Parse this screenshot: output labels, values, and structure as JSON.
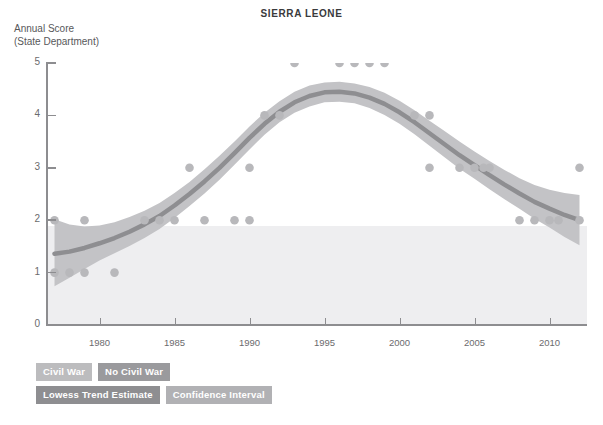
{
  "title": "SIERRA LEONE",
  "y_axis_label": "Annual Score\n(State Department)",
  "legend": [
    {
      "key": "civil_war",
      "label": "Civil War",
      "color": "#bcbcbe"
    },
    {
      "key": "no_civil_war",
      "label": "No Civil War",
      "color": "#9a9a9d"
    },
    {
      "key": "lowess",
      "label": "Lowess Trend Estimate",
      "color": "#8e8e91"
    },
    {
      "key": "confidence_interval",
      "label": "Confidence Interval",
      "color": "#b1b1b4"
    }
  ],
  "chart_data": {
    "type": "scatter",
    "title": "SIERRA LEONE",
    "xlabel": "",
    "ylabel": "Annual Score (State Department)",
    "xlim": [
      1976.5,
      2012.5
    ],
    "ylim": [
      0,
      5
    ],
    "yticks": [
      0,
      1,
      2,
      3,
      4,
      5
    ],
    "xticks": [
      1980,
      1985,
      1990,
      1995,
      2000,
      2005,
      2010
    ],
    "grid": false,
    "legend_position": "below-left",
    "points": [
      {
        "x": 1977,
        "y": 2
      },
      {
        "x": 1977,
        "y": 1
      },
      {
        "x": 1978,
        "y": 1
      },
      {
        "x": 1979,
        "y": 2
      },
      {
        "x": 1979,
        "y": 1
      },
      {
        "x": 1981,
        "y": 1
      },
      {
        "x": 1983,
        "y": 2
      },
      {
        "x": 1984,
        "y": 2
      },
      {
        "x": 1985,
        "y": 2
      },
      {
        "x": 1986,
        "y": 3
      },
      {
        "x": 1987,
        "y": 2
      },
      {
        "x": 1989,
        "y": 2
      },
      {
        "x": 1990,
        "y": 2
      },
      {
        "x": 1990,
        "y": 3
      },
      {
        "x": 1991,
        "y": 4
      },
      {
        "x": 1992,
        "y": 4
      },
      {
        "x": 1993,
        "y": 5
      },
      {
        "x": 1996,
        "y": 5
      },
      {
        "x": 1997,
        "y": 5
      },
      {
        "x": 1998,
        "y": 5
      },
      {
        "x": 1999,
        "y": 5
      },
      {
        "x": 2001,
        "y": 4
      },
      {
        "x": 2002,
        "y": 4
      },
      {
        "x": 2002,
        "y": 3
      },
      {
        "x": 2004,
        "y": 3
      },
      {
        "x": 2005,
        "y": 3
      },
      {
        "x": 2005.6,
        "y": 3
      },
      {
        "x": 2006,
        "y": 3
      },
      {
        "x": 2008,
        "y": 2
      },
      {
        "x": 2009,
        "y": 2
      },
      {
        "x": 2010,
        "y": 2
      },
      {
        "x": 2010.6,
        "y": 2
      },
      {
        "x": 2012,
        "y": 3
      },
      {
        "x": 2012,
        "y": 2
      }
    ],
    "lowess": [
      {
        "x": 1977,
        "y": 1.36
      },
      {
        "x": 1978,
        "y": 1.4
      },
      {
        "x": 1979,
        "y": 1.47
      },
      {
        "x": 1980,
        "y": 1.56
      },
      {
        "x": 1981,
        "y": 1.66
      },
      {
        "x": 1982,
        "y": 1.78
      },
      {
        "x": 1983,
        "y": 1.92
      },
      {
        "x": 1984,
        "y": 2.08
      },
      {
        "x": 1985,
        "y": 2.28
      },
      {
        "x": 1986,
        "y": 2.5
      },
      {
        "x": 1987,
        "y": 2.74
      },
      {
        "x": 1988,
        "y": 3.0
      },
      {
        "x": 1989,
        "y": 3.28
      },
      {
        "x": 1990,
        "y": 3.57
      },
      {
        "x": 1991,
        "y": 3.84
      },
      {
        "x": 1992,
        "y": 4.07
      },
      {
        "x": 1993,
        "y": 4.25
      },
      {
        "x": 1994,
        "y": 4.37
      },
      {
        "x": 1995,
        "y": 4.44
      },
      {
        "x": 1996,
        "y": 4.45
      },
      {
        "x": 1997,
        "y": 4.42
      },
      {
        "x": 1998,
        "y": 4.34
      },
      {
        "x": 1999,
        "y": 4.22
      },
      {
        "x": 2000,
        "y": 4.06
      },
      {
        "x": 2001,
        "y": 3.87
      },
      {
        "x": 2002,
        "y": 3.66
      },
      {
        "x": 2003,
        "y": 3.45
      },
      {
        "x": 2004,
        "y": 3.24
      },
      {
        "x": 2005,
        "y": 3.05
      },
      {
        "x": 2006,
        "y": 2.86
      },
      {
        "x": 2007,
        "y": 2.68
      },
      {
        "x": 2008,
        "y": 2.51
      },
      {
        "x": 2009,
        "y": 2.35
      },
      {
        "x": 2010,
        "y": 2.22
      },
      {
        "x": 2011,
        "y": 2.1
      },
      {
        "x": 2012,
        "y": 2.0
      }
    ],
    "ci_upper": [
      {
        "x": 1977,
        "y": 2.02
      },
      {
        "x": 1978,
        "y": 1.92
      },
      {
        "x": 1979,
        "y": 1.88
      },
      {
        "x": 1980,
        "y": 1.9
      },
      {
        "x": 1981,
        "y": 1.96
      },
      {
        "x": 1982,
        "y": 2.06
      },
      {
        "x": 1983,
        "y": 2.18
      },
      {
        "x": 1984,
        "y": 2.33
      },
      {
        "x": 1985,
        "y": 2.52
      },
      {
        "x": 1986,
        "y": 2.73
      },
      {
        "x": 1987,
        "y": 2.97
      },
      {
        "x": 1988,
        "y": 3.23
      },
      {
        "x": 1989,
        "y": 3.5
      },
      {
        "x": 1990,
        "y": 3.79
      },
      {
        "x": 1991,
        "y": 4.05
      },
      {
        "x": 1992,
        "y": 4.27
      },
      {
        "x": 1993,
        "y": 4.45
      },
      {
        "x": 1994,
        "y": 4.57
      },
      {
        "x": 1995,
        "y": 4.63
      },
      {
        "x": 1996,
        "y": 4.64
      },
      {
        "x": 1997,
        "y": 4.61
      },
      {
        "x": 1998,
        "y": 4.54
      },
      {
        "x": 1999,
        "y": 4.43
      },
      {
        "x": 2000,
        "y": 4.28
      },
      {
        "x": 2001,
        "y": 4.1
      },
      {
        "x": 2002,
        "y": 3.9
      },
      {
        "x": 2003,
        "y": 3.7
      },
      {
        "x": 2004,
        "y": 3.5
      },
      {
        "x": 2005,
        "y": 3.31
      },
      {
        "x": 2006,
        "y": 3.13
      },
      {
        "x": 2007,
        "y": 2.96
      },
      {
        "x": 2008,
        "y": 2.8
      },
      {
        "x": 2009,
        "y": 2.67
      },
      {
        "x": 2010,
        "y": 2.58
      },
      {
        "x": 2011,
        "y": 2.52
      },
      {
        "x": 2012,
        "y": 2.48
      }
    ],
    "ci_lower": [
      {
        "x": 1977,
        "y": 0.74
      },
      {
        "x": 1978,
        "y": 0.9
      },
      {
        "x": 1979,
        "y": 1.07
      },
      {
        "x": 1980,
        "y": 1.23
      },
      {
        "x": 1981,
        "y": 1.37
      },
      {
        "x": 1982,
        "y": 1.51
      },
      {
        "x": 1983,
        "y": 1.66
      },
      {
        "x": 1984,
        "y": 1.83
      },
      {
        "x": 1985,
        "y": 2.04
      },
      {
        "x": 1986,
        "y": 2.27
      },
      {
        "x": 1987,
        "y": 2.51
      },
      {
        "x": 1988,
        "y": 2.77
      },
      {
        "x": 1989,
        "y": 3.06
      },
      {
        "x": 1990,
        "y": 3.35
      },
      {
        "x": 1991,
        "y": 3.63
      },
      {
        "x": 1992,
        "y": 3.87
      },
      {
        "x": 1993,
        "y": 4.05
      },
      {
        "x": 1994,
        "y": 4.17
      },
      {
        "x": 1995,
        "y": 4.25
      },
      {
        "x": 1996,
        "y": 4.26
      },
      {
        "x": 1997,
        "y": 4.23
      },
      {
        "x": 1998,
        "y": 4.14
      },
      {
        "x": 1999,
        "y": 4.01
      },
      {
        "x": 2000,
        "y": 3.84
      },
      {
        "x": 2001,
        "y": 3.64
      },
      {
        "x": 2002,
        "y": 3.42
      },
      {
        "x": 2003,
        "y": 3.2
      },
      {
        "x": 2004,
        "y": 2.98
      },
      {
        "x": 2005,
        "y": 2.79
      },
      {
        "x": 2006,
        "y": 2.59
      },
      {
        "x": 2007,
        "y": 2.4
      },
      {
        "x": 2008,
        "y": 2.22
      },
      {
        "x": 2009,
        "y": 2.03
      },
      {
        "x": 2010,
        "y": 1.86
      },
      {
        "x": 2011,
        "y": 1.68
      },
      {
        "x": 2012,
        "y": 1.52
      }
    ],
    "civil_war_band": {
      "from_year": 1976.5,
      "to_year": 2012.5,
      "score_range": [
        2,
        5
      ]
    },
    "no_civil_war_band": {
      "from_year": 1976.5,
      "to_year": 2012.5,
      "score_range": [
        0,
        2
      ]
    }
  },
  "colors": {
    "point": "#b8b8bb",
    "lowess_line": "#8e8e91",
    "ci_fill": "#c3c3c6",
    "civil_war_band": "#fdfdfd",
    "no_civil_war_band": "#eeeef0",
    "axis": "#8d8d90",
    "text": "#58585a"
  }
}
